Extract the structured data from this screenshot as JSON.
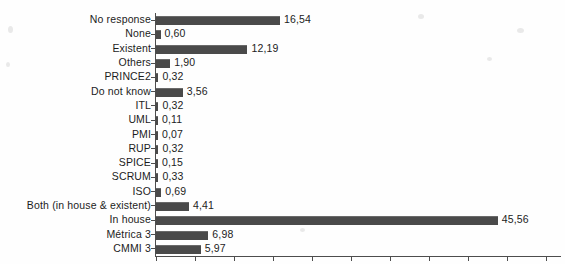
{
  "chart_data": {
    "type": "bar",
    "orientation": "horizontal",
    "title": "",
    "subtitle": "",
    "xlabel": "",
    "ylabel": "",
    "xlim": [
      0,
      52
    ],
    "ylim": null,
    "grid": false,
    "legend": null,
    "decimal_separator": ",",
    "axis": {
      "tick_step": 5,
      "ticks": [
        0,
        5,
        10,
        15,
        20,
        25,
        30,
        35,
        40,
        45,
        50
      ],
      "tick_labels_visible": false
    },
    "bar_color": "#4a4a4a",
    "axis_color": "#4d4d4d",
    "text_color": "#1c1c1c",
    "categories": [
      "No response",
      "None",
      "Existent",
      "Others",
      "PRINCE2",
      "Do not know",
      "ITL",
      "UML",
      "PMI",
      "RUP",
      "SPICE",
      "SCRUM",
      "ISO",
      "Both (in house & existent)",
      "In house",
      "Métrica 3",
      "CMMI 3"
    ],
    "values": [
      16.54,
      0.6,
      12.19,
      1.9,
      0.32,
      3.56,
      0.32,
      0.11,
      0.07,
      0.32,
      0.15,
      0.33,
      0.69,
      4.41,
      45.56,
      6.98,
      5.97
    ],
    "value_labels": [
      "16,54",
      "0,60",
      "12,19",
      "1,90",
      "0,32",
      "3,56",
      "0,32",
      "0,11",
      "0,07",
      "0,32",
      "0,15",
      "0,33",
      "0,69",
      "4,41",
      "45,56",
      "6,98",
      "5,97"
    ]
  }
}
